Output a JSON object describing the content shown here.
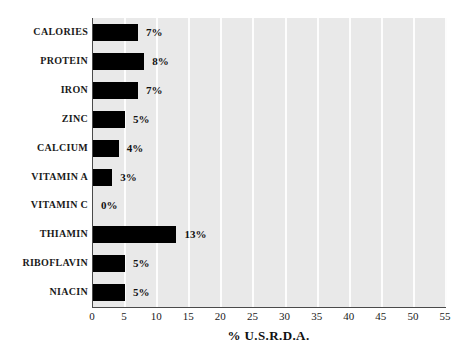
{
  "chart_data": {
    "type": "bar",
    "orientation": "horizontal",
    "title": "",
    "xlabel": "% U.S.R.D.A.",
    "ylabel": "",
    "xlim": [
      0,
      55
    ],
    "xticks": [
      0,
      5,
      10,
      15,
      20,
      25,
      30,
      35,
      40,
      45,
      50,
      55
    ],
    "xtick_labels": [
      "0",
      "5",
      "10",
      "15",
      "20",
      "25",
      "30",
      "35",
      "40",
      "45",
      "50",
      "55"
    ],
    "grid": "vertical",
    "legend": "none",
    "categories": [
      "CALORIES",
      "PROTEIN",
      "IRON",
      "ZINC",
      "CALCIUM",
      "VITAMIN A",
      "VITAMIN C",
      "THIAMIN",
      "RIBOFLAVIN",
      "NIACIN"
    ],
    "values": [
      7,
      8,
      7,
      5,
      4,
      3,
      0,
      13,
      5,
      5
    ],
    "value_labels": [
      "7%",
      "8%",
      "7%",
      "5%",
      "4%",
      "3%",
      "0%",
      "13%",
      "5%",
      "5%"
    ],
    "colors": {
      "bar": "#000000",
      "plot_background": "#e9e9e9",
      "gridline": "#fdfdfd",
      "axis": "#4a4a4a",
      "text": "#111111",
      "page_background": "#ffffff"
    }
  }
}
